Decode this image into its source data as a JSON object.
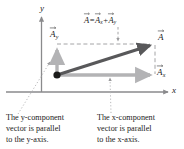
{
  "figure": {
    "axes": {
      "x_label": "x",
      "y_label": "y"
    },
    "equation": {
      "lhs": "A",
      "equals": "=",
      "term1": "A",
      "term1_sub": "x",
      "plus": "+",
      "term2": "A",
      "term2_sub": "y"
    },
    "vectors": [
      {
        "name": "resultant",
        "label": "A",
        "subscript": "",
        "color": "#58585a",
        "from": [
          57,
          75
        ],
        "to": [
          155,
          44
        ]
      },
      {
        "name": "x-component",
        "label": "A",
        "subscript": "x",
        "color": "#b3b3b5",
        "from": [
          57,
          75
        ],
        "to": [
          155,
          75
        ]
      },
      {
        "name": "y-component",
        "label": "A",
        "subscript": "y",
        "color": "#b3b3b5",
        "from": [
          57,
          75
        ],
        "to": [
          57,
          45
        ]
      }
    ],
    "origin_dot": {
      "cx": 57,
      "cy": 75,
      "r": 3.6,
      "color": "#1b1b1b"
    },
    "captions": [
      {
        "name": "y-component-caption",
        "lines": [
          "The y-component",
          "vector is parallel",
          "to the y-axis."
        ]
      },
      {
        "name": "x-component-caption",
        "lines": [
          "The x-component",
          "vector is parallel",
          "to the x-axis."
        ]
      }
    ],
    "colors": {
      "axis": "#8a8a8c",
      "resultant": "#58585a",
      "component": "#b3b3b5",
      "dashed": "#9a9a9c",
      "dotted_leader": "#b0b0b2",
      "text": "#1b1b1b",
      "background": "#ffffff"
    }
  }
}
